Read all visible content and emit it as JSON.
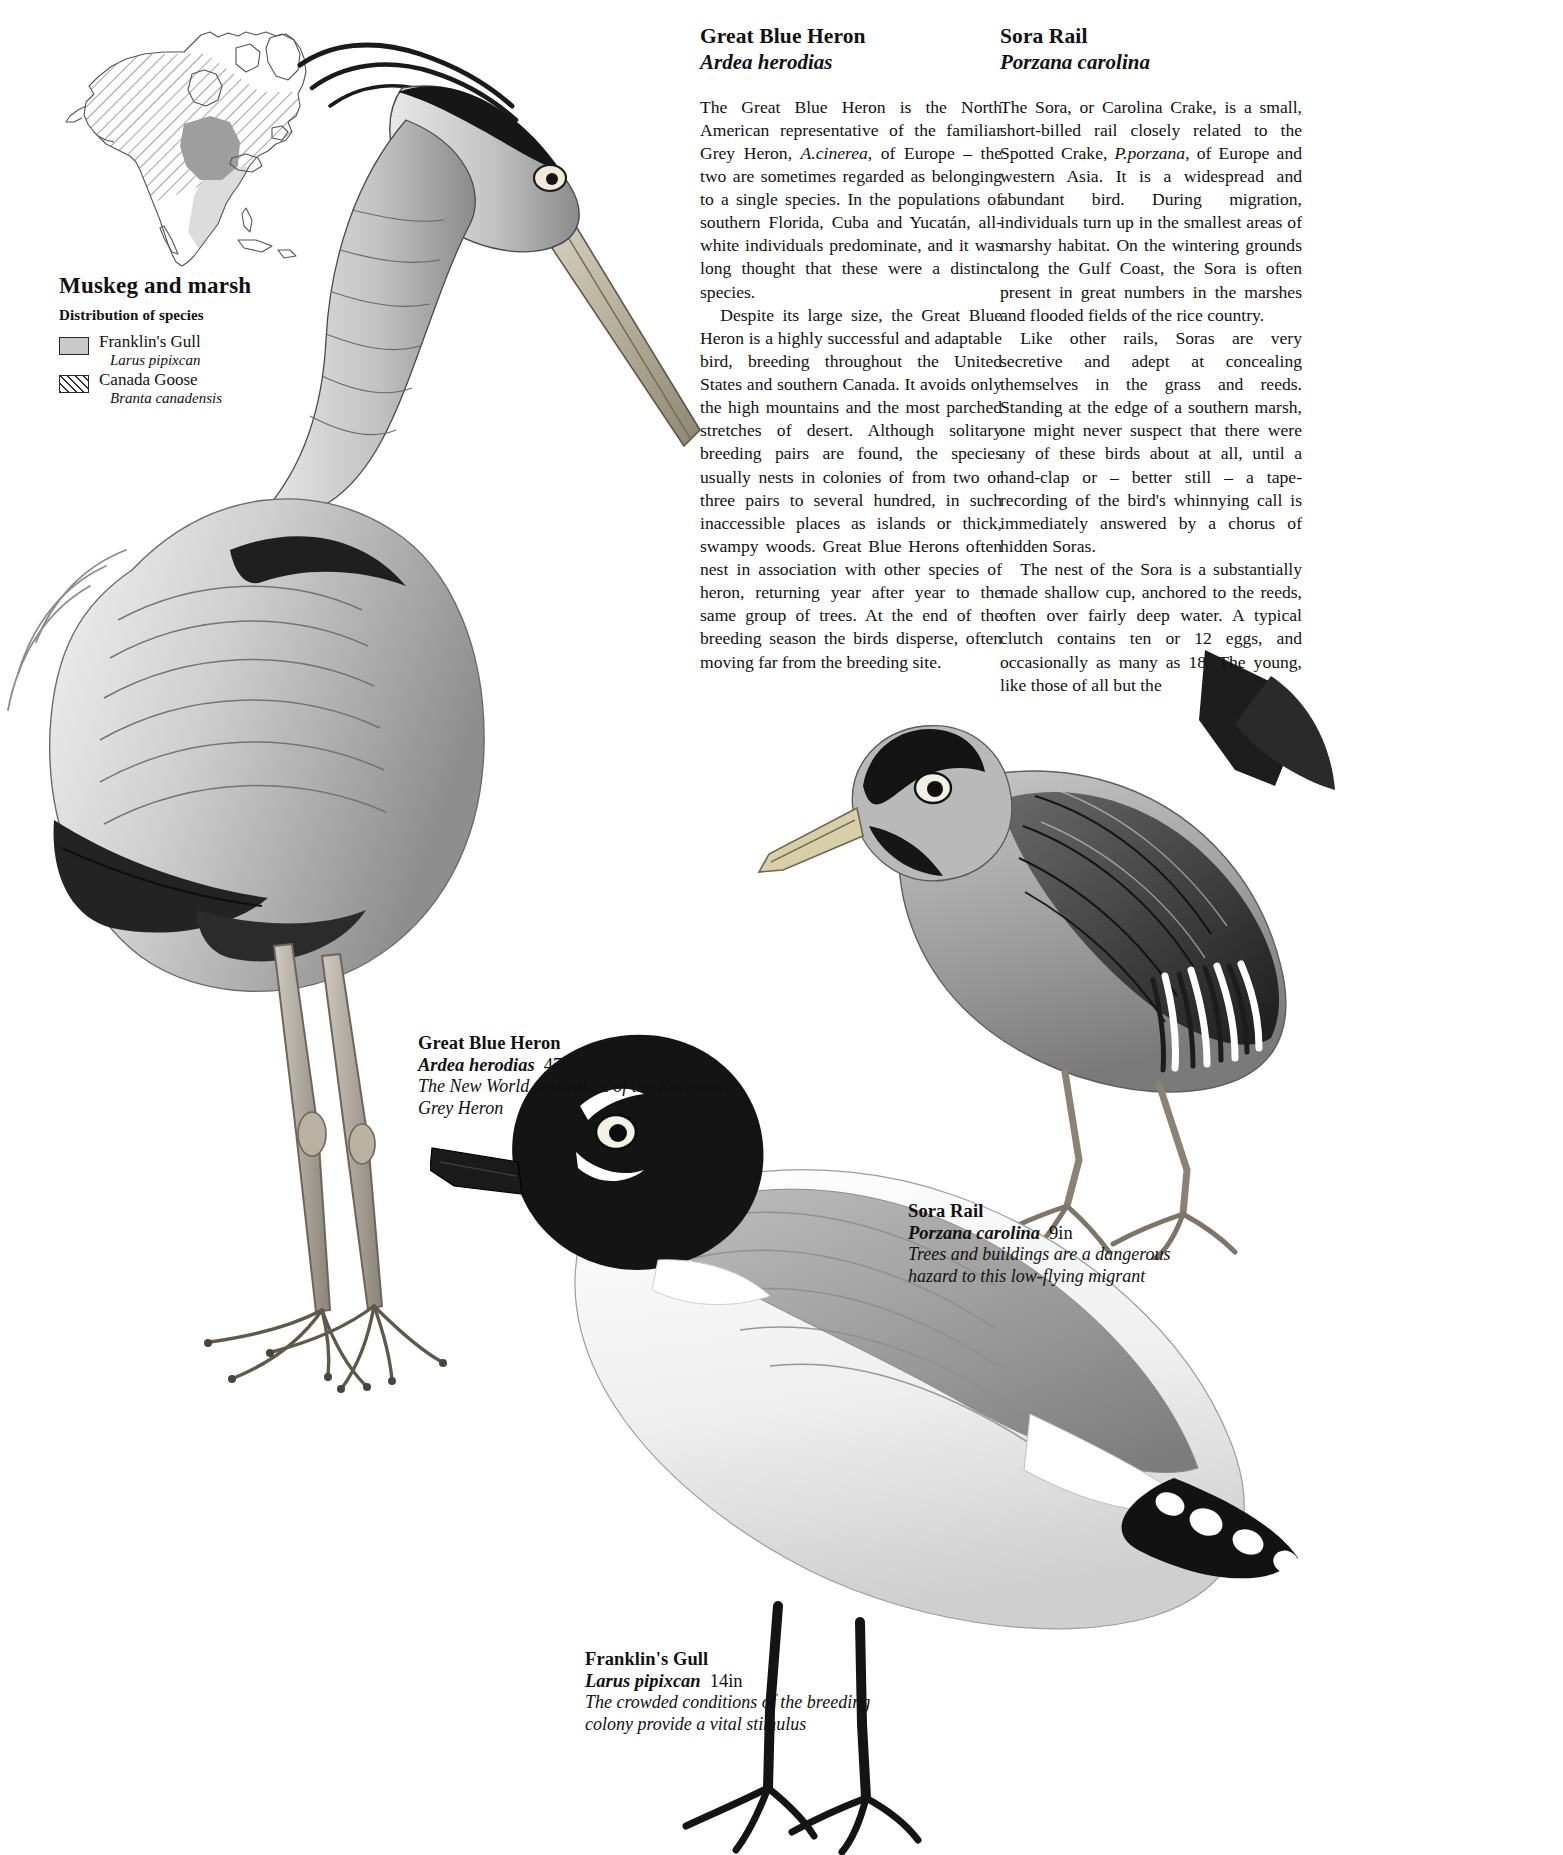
{
  "map": {
    "title": "Muskeg and marsh",
    "subtitle": "Distribution of species",
    "legend": [
      {
        "swatch": "solid-grey",
        "common": "Franklin's Gull",
        "scientific": "Larus pipixcan"
      },
      {
        "swatch": "diagonal-hatch",
        "common": "Canada Goose",
        "scientific": "Branta canadensis"
      }
    ]
  },
  "articles": [
    {
      "title": "Great Blue Heron",
      "scientific": "Ardea herodias",
      "paragraphs": [
        "The Great Blue Heron is the North American representative of the familiar Grey Heron, <i>A.cinerea</i>, of Europe – the two are sometimes regarded as belonging to a single species. In the populations of southern Florida, Cuba and Yucatán, all-white individuals predominate, and it was long thought that these were a distinct species.",
        "Despite its large size, the Great Blue Heron is a highly successful and adaptable bird, breeding throughout the United States and southern Canada. It avoids only the high mountains and the most parched stretches of desert. Although solitary breeding pairs are found, the species usually nests in colonies of from two or three pairs to several hundred, in such inaccessible places as islands or thick, swampy woods. Great Blue Herons often nest in association with other species of heron, returning year after year to the same group of trees. At the end of the breeding season the birds disperse, often moving far from the breeding site."
      ]
    },
    {
      "title": "Sora Rail",
      "scientific": "Porzana carolina",
      "paragraphs": [
        "The Sora, or Carolina Crake, is a small, short-billed rail closely related to the Spotted Crake, <i>P.porzana</i>, of Europe and western Asia. It is a widespread and abundant bird. During migration, individuals turn up in the smallest areas of marshy habitat. On the wintering grounds along the Gulf Coast, the Sora is often present in great numbers in the marshes and flooded fields of the rice country.",
        "Like other rails, Soras are very secretive and adept at concealing themselves in the grass and reeds. Standing at the edge of a southern marsh, one might never suspect that there were any of these birds about at all, until a hand-clap or – better still – a tape-recording of the bird's whinnying call is immediately answered by a chorus of hidden Soras.",
        "The nest of the Sora is a substantially made shallow cup, anchored to the reeds, often over fairly deep water. A typical clutch contains ten or 12 eggs, and occasionally as many as 18. The young, like those of all but the"
      ]
    }
  ],
  "figures": [
    {
      "id": "great-blue-heron",
      "common": "Great Blue Heron",
      "scientific": "Ardea herodias",
      "size": "47in",
      "note": "The New World equivalent of the European Grey Heron"
    },
    {
      "id": "sora-rail",
      "common": "Sora Rail",
      "scientific": "Porzana carolina",
      "size": "9in",
      "note": "Trees and buildings are a dangerous hazard to this low-flying migrant"
    },
    {
      "id": "franklins-gull",
      "common": "Franklin's Gull",
      "scientific": "Larus pipixcan",
      "size": "14in",
      "note": "The crowded conditions of the breeding colony provide a vital stimulus"
    }
  ],
  "colors": {
    "page_background": "#ffffff",
    "ink": "#111111",
    "map_land_fill": "#ffffff",
    "map_outline": "#555555",
    "gull_range_fill": "#d9d9d9",
    "goose_range_hatch": "#2e2e2e",
    "dark_overlap_fill": "#9a9a9a"
  }
}
